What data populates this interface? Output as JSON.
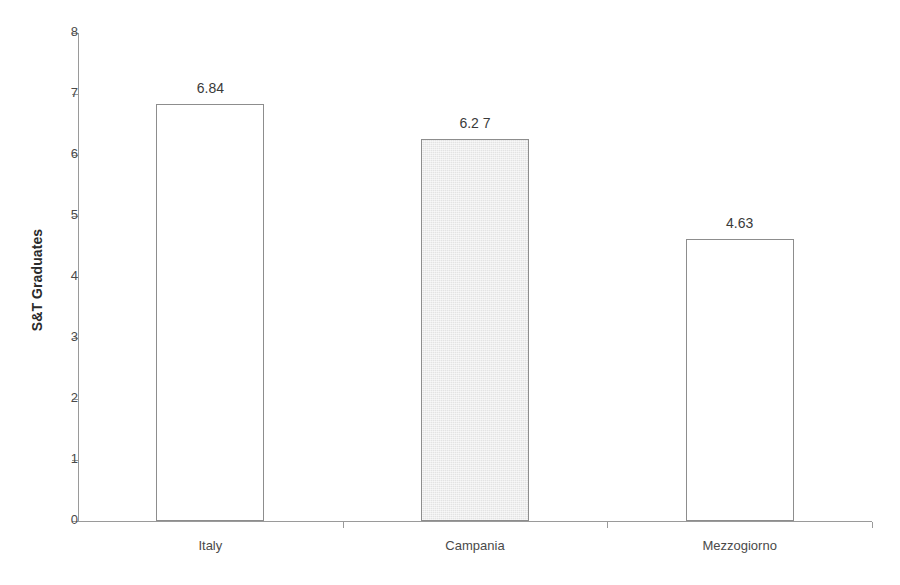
{
  "chart_data": {
    "type": "bar",
    "title": "",
    "subtitle": "",
    "xlabel": "",
    "ylabel": "S&T Graduates",
    "categories": [
      "Italy",
      "Campania",
      "Mezzogiorno"
    ],
    "values": [
      6.84,
      6.27,
      4.63
    ],
    "value_labels": [
      "6.84",
      "6.2 7",
      "4.63"
    ],
    "series": [
      {
        "name": "S&T Graduates",
        "values": [
          6.84,
          6.27,
          4.63
        ]
      }
    ],
    "ylim": [
      0,
      8
    ],
    "ytick_step": 1,
    "ytick_labels": [
      "8",
      "7",
      "6",
      "5",
      "4",
      "3",
      "2",
      "1",
      "0"
    ],
    "ytick_values": [
      8,
      7,
      6,
      5,
      4,
      3,
      2,
      1,
      0
    ],
    "grid": false,
    "legend": false,
    "legend_position": "none",
    "bar_styles": [
      {
        "category": "Italy",
        "fill": "#ffffff",
        "border": "#8d8d8d",
        "pattern": "none"
      },
      {
        "category": "Campania",
        "fill": "#e3e3e3",
        "border": "#8d8d8d",
        "pattern": "fine-dither"
      },
      {
        "category": "Mezzogiorno",
        "fill": "#ffffff",
        "border": "#8d8d8d",
        "pattern": "none"
      }
    ],
    "annotations": []
  },
  "colors": {
    "axis": "#9a9a9a",
    "text": "#4a4a4a",
    "value_text": "#3a3a3a",
    "title_text": "#2b2b2b",
    "bar_fill_highlight": "#e3e3e3",
    "bar_border": "#8d8d8d",
    "background": "#ffffff"
  }
}
